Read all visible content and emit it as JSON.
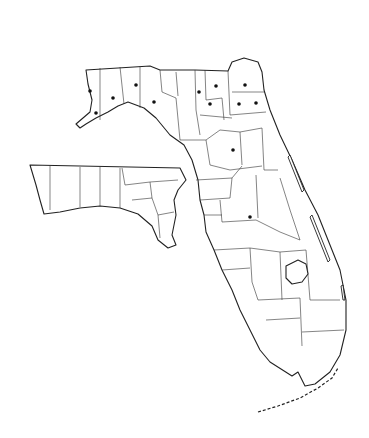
{
  "map": {
    "title": "",
    "subject": "Florida county outline map",
    "inset": "Western panhandle shown as inset at left",
    "line_color": "#222222",
    "background": "#ffffff",
    "marker_color": "#111111",
    "markers": [
      {
        "x": 90,
        "y": 91
      },
      {
        "x": 113,
        "y": 98
      },
      {
        "x": 136,
        "y": 85
      },
      {
        "x": 154,
        "y": 102
      },
      {
        "x": 96,
        "y": 113
      },
      {
        "x": 199,
        "y": 92
      },
      {
        "x": 216,
        "y": 86
      },
      {
        "x": 210,
        "y": 104
      },
      {
        "x": 245,
        "y": 85
      },
      {
        "x": 239,
        "y": 104
      },
      {
        "x": 256,
        "y": 103
      },
      {
        "x": 233,
        "y": 150
      },
      {
        "x": 250,
        "y": 217
      }
    ]
  }
}
